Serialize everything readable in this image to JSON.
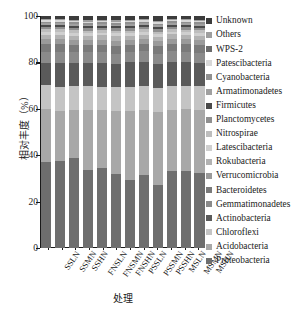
{
  "chart_data": {
    "type": "bar",
    "stacked": true,
    "title": "",
    "xlabel": "处理",
    "ylabel": "相对丰度（%）",
    "ylim": [
      0,
      100
    ],
    "yticks": [
      0,
      20,
      40,
      60,
      80,
      100
    ],
    "ytick_labels": [
      "0",
      "20",
      "40",
      "60",
      "80",
      "100"
    ],
    "grid": false,
    "legend_position": "right",
    "categories": [
      "SSLN",
      "SSMN",
      "SSHN",
      "FNSLN",
      "FNSMN",
      "FNSHN",
      "PSSLN",
      "PSSMN",
      "PSSHN",
      "MSLN",
      "MSMN",
      "MSHN"
    ],
    "series": [
      {
        "name": "Proteobacteria",
        "color": "#6e6e6e",
        "values": [
          37.5,
          37.8,
          38.7,
          33.8,
          34.5,
          32.2,
          29.3,
          31.8,
          27.5,
          33.5,
          33.3,
          32.3
        ]
      },
      {
        "name": "Acidobacteria",
        "color": "#a8a8a8",
        "values": [
          23.0,
          21.6,
          20.8,
          26.2,
          25.2,
          27.3,
          30.0,
          28.5,
          31.5,
          26.5,
          26.8,
          27.5
        ]
      },
      {
        "name": "Chloroflexi",
        "color": "#c4c4c4",
        "values": [
          10.6,
          10.4,
          10.3,
          10.2,
          10.1,
          10.2,
          10.5,
          10.4,
          10.7,
          10.4,
          10.2,
          10.3
        ]
      },
      {
        "name": "Actinobacteria",
        "color": "#5a5a5a",
        "values": [
          9.6,
          10.5,
          10.0,
          10.2,
          10.4,
          10.0,
          10.6,
          10.5,
          10.3,
          10.3,
          10.2,
          10.1
        ]
      },
      {
        "name": "Gemmatimonadetes",
        "color": "#8a8a8a",
        "values": [
          4.8,
          4.6,
          4.5,
          4.4,
          4.6,
          4.5,
          4.4,
          4.5,
          4.6,
          4.5,
          4.6,
          4.5
        ]
      },
      {
        "name": "Bacteroidetes",
        "color": "#7a7a7a",
        "values": [
          3.4,
          3.3,
          3.2,
          3.1,
          3.3,
          3.4,
          3.2,
          3.3,
          3.2,
          3.3,
          3.2,
          3.3
        ]
      },
      {
        "name": "Verrucomicrobia",
        "color": "#9a9a9a",
        "values": [
          2.2,
          2.3,
          2.2,
          2.1,
          2.2,
          2.3,
          2.2,
          2.1,
          2.2,
          2.2,
          2.3,
          2.2
        ]
      },
      {
        "name": "Rokubacteria",
        "color": "#b2b2b2",
        "values": [
          1.8,
          1.9,
          1.8,
          1.9,
          1.8,
          1.9,
          1.8,
          1.9,
          1.8,
          1.9,
          1.8,
          1.9
        ]
      },
      {
        "name": "Latescibacteria",
        "color": "#cfcfcf",
        "values": [
          1.2,
          1.2,
          1.3,
          1.2,
          1.2,
          1.3,
          1.2,
          1.2,
          1.3,
          1.2,
          1.2,
          1.3
        ]
      },
      {
        "name": "Nitrospirae",
        "color": "#bdbdbd",
        "values": [
          1.1,
          1.1,
          1.0,
          1.1,
          1.0,
          1.1,
          1.0,
          1.1,
          1.0,
          1.1,
          1.0,
          1.1
        ]
      },
      {
        "name": "Planctomycetes",
        "color": "#8f8f8f",
        "values": [
          1.0,
          1.0,
          1.1,
          1.0,
          1.1,
          1.0,
          1.1,
          1.0,
          1.1,
          1.0,
          1.1,
          1.0
        ]
      },
      {
        "name": "Firmicutes",
        "color": "#4a4a4a",
        "values": [
          0.9,
          0.9,
          0.9,
          0.9,
          0.9,
          0.9,
          0.9,
          0.9,
          0.9,
          0.9,
          0.9,
          0.9
        ]
      },
      {
        "name": "Armatimonadetes",
        "color": "#a0a0a0",
        "values": [
          0.8,
          0.8,
          0.8,
          0.8,
          0.8,
          0.8,
          0.8,
          0.8,
          0.8,
          0.8,
          0.8,
          0.8
        ]
      },
      {
        "name": "Cyanobacteria",
        "color": "#909090",
        "values": [
          0.7,
          0.7,
          0.7,
          0.7,
          0.7,
          0.7,
          0.7,
          0.7,
          0.7,
          0.7,
          0.7,
          0.7
        ]
      },
      {
        "name": "Patescibacteria",
        "color": "#d8d8d8",
        "values": [
          0.6,
          0.6,
          0.6,
          0.6,
          0.6,
          0.6,
          0.6,
          0.6,
          0.6,
          0.6,
          0.6,
          0.6
        ]
      },
      {
        "name": "Others",
        "color": "#9e9e9e",
        "values": [
          0.5,
          0.5,
          0.5,
          0.5,
          0.5,
          0.5,
          0.5,
          0.5,
          0.5,
          0.5,
          0.5,
          0.5
        ]
      },
      {
        "name": "Unknown",
        "color": "#3c3c3c",
        "values": [
          1.3,
          1.3,
          1.6,
          1.9,
          1.6,
          1.9,
          1.7,
          1.3,
          2.3,
          1.2,
          1.4,
          1.6
        ]
      }
    ]
  },
  "legend": {
    "items": [
      {
        "label": "Unknown",
        "color": "#3c3c3c"
      },
      {
        "label": "Others",
        "color": "#9e9e9e"
      },
      {
        "label": "WPS-2",
        "color": "#6b6b6b"
      },
      {
        "label": "Patescibacteria",
        "color": "#d8d8d8"
      },
      {
        "label": "Cyanobacteria",
        "color": "#909090"
      },
      {
        "label": "Armatimonadetes",
        "color": "#a0a0a0"
      },
      {
        "label": "Firmicutes",
        "color": "#4a4a4a"
      },
      {
        "label": "Planctomycetes",
        "color": "#8f8f8f"
      },
      {
        "label": "Nitrospirae",
        "color": "#bdbdbd"
      },
      {
        "label": "Latescibacteria",
        "color": "#cfcfcf"
      },
      {
        "label": "Rokubacteria",
        "color": "#b2b2b2"
      },
      {
        "label": "Verrucomicrobia",
        "color": "#9a9a9a"
      },
      {
        "label": "Bacteroidetes",
        "color": "#7a7a7a"
      },
      {
        "label": "Gemmatimonadetes",
        "color": "#8a8a8a"
      },
      {
        "label": "Actinobacteria",
        "color": "#5a5a5a"
      },
      {
        "label": "Chloroflexi",
        "color": "#c4c4c4"
      },
      {
        "label": "Acidobacteria",
        "color": "#a8a8a8"
      },
      {
        "label": "Proteobacteria",
        "color": "#6e6e6e"
      }
    ]
  }
}
